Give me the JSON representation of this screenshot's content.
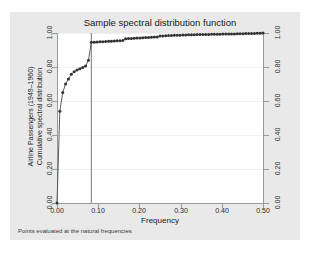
{
  "chart_data": {
    "type": "line",
    "title": "Sample spectral distribution function",
    "xlabel": "Frequency",
    "ylabel_line1": "Airline Passengers (1949–1960)",
    "ylabel_line2": "Cumulative spectral distribution",
    "note": "Points evaluated at the natural frequencies",
    "xlim": [
      0.0,
      0.5
    ],
    "ylim": [
      0.0,
      1.0
    ],
    "grid": true,
    "legend": "none",
    "marker": "filled-circle",
    "reference_line_x": 0.0833,
    "xticks": [
      "0.00",
      "0.10",
      "0.20",
      "0.30",
      "0.40",
      "0.50"
    ],
    "xtick_values": [
      0.0,
      0.1,
      0.2,
      0.3,
      0.4,
      0.5
    ],
    "yticks": [
      "0.00",
      "0.20",
      "0.40",
      "0.60",
      "0.80",
      "1.00"
    ],
    "ytick_values": [
      0.0,
      0.2,
      0.4,
      0.6,
      0.8,
      1.0
    ],
    "yticks_right": [
      "0.00",
      "0.20",
      "0.40",
      "0.60",
      "0.80",
      "1.00"
    ],
    "series": [
      {
        "name": "Cumulative spectral distribution",
        "x": [
          0.0,
          0.0069,
          0.0139,
          0.0208,
          0.0278,
          0.0347,
          0.0417,
          0.0486,
          0.0556,
          0.0625,
          0.0694,
          0.0764,
          0.0833,
          0.0903,
          0.0972,
          0.1042,
          0.1111,
          0.1181,
          0.125,
          0.1319,
          0.1389,
          0.1458,
          0.1528,
          0.1597,
          0.1667,
          0.1736,
          0.1806,
          0.1875,
          0.1944,
          0.2014,
          0.2083,
          0.2153,
          0.2222,
          0.2292,
          0.2361,
          0.2431,
          0.25,
          0.2569,
          0.2639,
          0.2708,
          0.2778,
          0.2847,
          0.2917,
          0.2986,
          0.3056,
          0.3125,
          0.3194,
          0.3264,
          0.3333,
          0.3403,
          0.3472,
          0.3542,
          0.3611,
          0.3681,
          0.375,
          0.3819,
          0.3889,
          0.3958,
          0.4028,
          0.4097,
          0.4167,
          0.4236,
          0.4306,
          0.4375,
          0.4444,
          0.4514,
          0.4583,
          0.4653,
          0.4722,
          0.4792,
          0.4861,
          0.4931,
          0.5
        ],
        "y": [
          0.0,
          0.54,
          0.65,
          0.7,
          0.73,
          0.758,
          0.772,
          0.782,
          0.79,
          0.797,
          0.806,
          0.84,
          0.945,
          0.946,
          0.947,
          0.948,
          0.949,
          0.95,
          0.951,
          0.952,
          0.953,
          0.954,
          0.955,
          0.956,
          0.966,
          0.967,
          0.968,
          0.969,
          0.97,
          0.971,
          0.972,
          0.973,
          0.974,
          0.975,
          0.976,
          0.977,
          0.982,
          0.983,
          0.984,
          0.985,
          0.986,
          0.9865,
          0.987,
          0.9875,
          0.988,
          0.9885,
          0.989,
          0.9895,
          0.99,
          0.9905,
          0.991,
          0.9913,
          0.9916,
          0.9919,
          0.9922,
          0.9925,
          0.9928,
          0.9931,
          0.9934,
          0.9937,
          0.994,
          0.9944,
          0.9948,
          0.9952,
          0.9956,
          0.996,
          0.9964,
          0.9968,
          0.9972,
          0.9976,
          0.9982,
          0.999,
          1.0
        ]
      }
    ],
    "colors": {
      "line": "#4a4a4a",
      "marker": "#333333",
      "plot_background": "#ffffff",
      "canvas_background": "#e9e9e9",
      "page_background": "#ffffff",
      "gridline": "#f0f0f0",
      "axis": "#9a9a9a",
      "reference_line": "#555555"
    }
  }
}
